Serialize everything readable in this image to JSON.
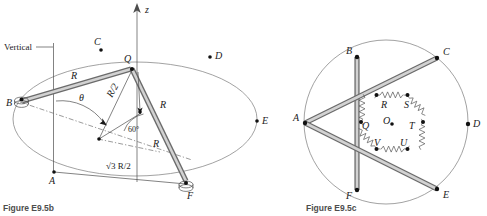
{
  "figures": [
    {
      "id": "fig-b",
      "caption": "Figure E9.5b",
      "axis_label": "z",
      "vertical_label": "Vertical",
      "angle_label": "θ",
      "angle_value": "60°",
      "length_labels": [
        "R",
        "R/2",
        "R",
        "R",
        "√3 R/2"
      ],
      "ring_points": [
        "C",
        "D",
        "E",
        "A",
        "B",
        "F"
      ],
      "joint_labels": [
        "Q"
      ],
      "bearing_points": [
        "B",
        "F"
      ]
    },
    {
      "id": "fig-c",
      "caption": "Figure E9.5c",
      "outer_points": [
        "B",
        "C",
        "D",
        "E",
        "F",
        "A"
      ],
      "center_label": "O",
      "hub_points": [
        "R",
        "S",
        "T",
        "U",
        "V",
        "Q"
      ],
      "spring_count": 6,
      "rod_count": 3
    }
  ],
  "colors": {
    "rod_outline": "#6b6b6b",
    "rod_fill": "#d2d2d2",
    "curve": "#7a7a7a",
    "caption": "#4d4d4d",
    "ink": "#1a1a1a",
    "background": "#ffffff"
  }
}
